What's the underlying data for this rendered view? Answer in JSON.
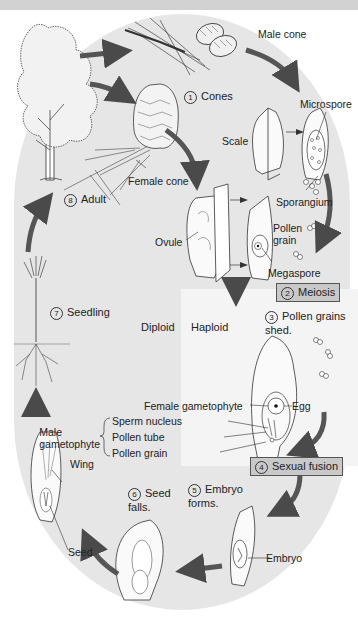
{
  "diagram": {
    "regions": {
      "diploid": "Diploid",
      "haploid": "Haploid"
    },
    "steps": [
      {
        "num": "1",
        "label": "Cones"
      },
      {
        "num": "2",
        "label": "Meiosis"
      },
      {
        "num": "3",
        "label": "Pollen grains\nshed."
      },
      {
        "num": "4",
        "label": "Sexual fusion"
      },
      {
        "num": "5",
        "label": "Embryo\nforms."
      },
      {
        "num": "6",
        "label": "Seed\nfalls."
      },
      {
        "num": "7",
        "label": "Seedling"
      },
      {
        "num": "8",
        "label": "Adult"
      }
    ],
    "labels": {
      "male_cone": "Male cone",
      "female_cone": "Female cone",
      "microspore": "Microspore",
      "scale": "Scale",
      "sporangium": "Sporangium",
      "ovule": "Ovule",
      "pollen_grain_top": "Pollen\ngrain",
      "megaspore": "Megaspore",
      "female_gametophyte": "Female gametophyte",
      "egg": "Egg",
      "male_gametophyte": "Male\ngametophyte",
      "sperm_nucleus": "Sperm nucleus",
      "pollen_tube": "Pollen tube",
      "pollen_grain": "Pollen grain",
      "embryo": "Embryo",
      "wing": "Wing",
      "seed": "Seed"
    },
    "colors": {
      "oval_background": "#e6e6e6",
      "haploid_background": "#f4f4f4",
      "top_band": "#d2d2d2",
      "arrow": "#555555",
      "label_box": "#c9c9c9"
    }
  }
}
